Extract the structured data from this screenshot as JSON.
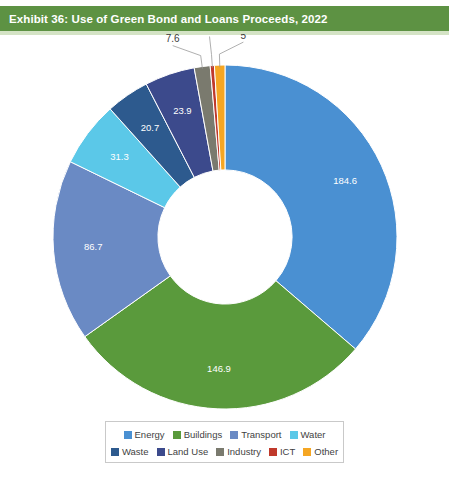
{
  "banner": {
    "title": "Exhibit 36: Use of Green Bond and Loans Proceeds, 2022",
    "bg_color": "#5d9243",
    "text_color": "#ffffff"
  },
  "legend": {
    "row1": [
      {
        "label": "Energy",
        "color": "#4a90d2"
      },
      {
        "label": "Buildings",
        "color": "#5a9a3c"
      },
      {
        "label": "Transport",
        "color": "#6a8ac4"
      },
      {
        "label": "Water",
        "color": "#5bc8e8"
      }
    ],
    "row2": [
      {
        "label": "Waste",
        "color": "#2d5a8e"
      },
      {
        "label": "Land Use",
        "color": "#3c4a8c"
      },
      {
        "label": "Industry",
        "color": "#7a7a6e"
      },
      {
        "label": "ICT",
        "color": "#c0392b"
      },
      {
        "label": "Other",
        "color": "#f5a623"
      }
    ]
  },
  "chart_data": {
    "type": "pie",
    "variant": "donut",
    "title": "Exhibit 36: Use of Green Bond and Loans Proceeds, 2022",
    "xlabel": "",
    "ylabel": "",
    "legend_position": "bottom",
    "grid": false,
    "categories": [
      "Energy",
      "Buildings",
      "Transport",
      "Water",
      "Waste",
      "Land Use",
      "Industry",
      "ICT",
      "Other"
    ],
    "values": [
      184.6,
      146.9,
      86.7,
      31.3,
      20.7,
      23.9,
      7.6,
      2,
      5
    ],
    "labels": [
      "184.6",
      "146.9",
      "86.7",
      "31.3",
      "20.7",
      "23.9",
      "7.6",
      "2",
      "5"
    ],
    "colors": [
      "#4a90d2",
      "#5a9a3c",
      "#6a8ac4",
      "#5bc8e8",
      "#2d5a8e",
      "#3c4a8c",
      "#7a7a6e",
      "#c0392b",
      "#f5a623"
    ],
    "label_placement": [
      "inside",
      "inside",
      "inside",
      "inside",
      "inside",
      "inside",
      "outside",
      "outside",
      "outside"
    ],
    "start_angle_deg": 0,
    "direction": "clockwise",
    "inner_radius_ratio": 0.39,
    "total": 508.7
  }
}
